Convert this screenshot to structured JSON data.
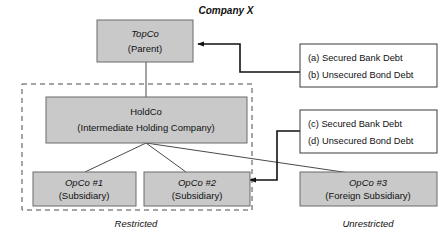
{
  "title": "Company X",
  "entities": {
    "topco": {
      "name": "TopCo",
      "role": "(Parent)"
    },
    "holdco": {
      "name": "HoldCo",
      "role": "(Intermediate Holding Company)"
    },
    "opco1": {
      "name": "OpCo #1",
      "role": "(Subsidiary)"
    },
    "opco2": {
      "name": "OpCo #2",
      "role": "(Subsidiary)"
    },
    "opco3": {
      "name": "OpCo #3",
      "role": "(Foreign Subsidiary)"
    }
  },
  "debt_boxes": {
    "upper": {
      "line1": "(a) Secured Bank Debt",
      "line2": "(b) Unsecured Bond Debt"
    },
    "lower": {
      "line1": "(c) Secured Bank Debt",
      "line2": "(d) Unsecured Bond Debt"
    }
  },
  "zones": {
    "restricted": "Restricted",
    "unrestricted": "Unrestricted"
  },
  "colors": {
    "entity_fill": "#c9c9c9",
    "entity_stroke": "#6b6b6b",
    "debt_fill": "#ffffff",
    "debt_stroke": "#3a3a3a",
    "frame_stroke": "#4a4a4a",
    "arrow": "#111111",
    "text": "#111111"
  }
}
